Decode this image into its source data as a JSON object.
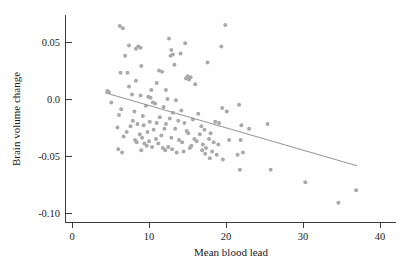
{
  "chart_data": {
    "type": "scatter",
    "title": "",
    "xlabel": "Mean blood lead",
    "ylabel": "Brain volume change",
    "xlim": [
      -1.0,
      42.5
    ],
    "ylim": [
      -0.115,
      0.075
    ],
    "grid": false,
    "legend": null,
    "xticks": [
      0,
      10,
      20,
      30,
      40
    ],
    "xticklabels": [
      "0",
      "10",
      "20",
      "30",
      "40"
    ],
    "yticks": [
      0.05,
      0.0,
      -0.05,
      -0.1
    ],
    "yticklabels": [
      "0.05",
      "0.0",
      "-0.05",
      "-0.10"
    ],
    "marker": {
      "shape": "circle",
      "color": "#a9a9a9",
      "size": 2.0
    },
    "series": [
      {
        "name": "Subjects",
        "points": [
          [
            6.2,
            0.064
          ],
          [
            6.6,
            0.062
          ],
          [
            19.9,
            0.065
          ],
          [
            12.6,
            0.053
          ],
          [
            14.7,
            0.049
          ],
          [
            7.4,
            0.047
          ],
          [
            8.6,
            0.046
          ],
          [
            8.9,
            0.045
          ],
          [
            8.3,
            0.044
          ],
          [
            19.4,
            0.046
          ],
          [
            12.9,
            0.043
          ],
          [
            14.1,
            0.04
          ],
          [
            13.1,
            0.039
          ],
          [
            12.8,
            0.038
          ],
          [
            6.9,
            0.038
          ],
          [
            17.6,
            0.032
          ],
          [
            13.3,
            0.03
          ],
          [
            9.0,
            0.029
          ],
          [
            11.3,
            0.025
          ],
          [
            11.7,
            0.024
          ],
          [
            6.3,
            0.023
          ],
          [
            7.2,
            0.023
          ],
          [
            15.0,
            0.02
          ],
          [
            15.4,
            0.019
          ],
          [
            14.8,
            0.018
          ],
          [
            15.2,
            0.017
          ],
          [
            8.3,
            0.016
          ],
          [
            11.0,
            0.014
          ],
          [
            16.0,
            0.013
          ],
          [
            7.4,
            0.011
          ],
          [
            10.3,
            0.008
          ],
          [
            12.2,
            0.008
          ],
          [
            4.6,
            0.007
          ],
          [
            4.8,
            0.006
          ],
          [
            7.8,
            0.004
          ],
          [
            8.9,
            0.003
          ],
          [
            9.9,
            0.002
          ],
          [
            10.2,
            0.001
          ],
          [
            12.4,
            0.0
          ],
          [
            13.5,
            -0.001
          ],
          [
            5.1,
            -0.003
          ],
          [
            10.5,
            -0.003
          ],
          [
            10.8,
            -0.004
          ],
          [
            9.6,
            -0.006
          ],
          [
            11.9,
            -0.007
          ],
          [
            6.4,
            -0.009
          ],
          [
            14.2,
            -0.01
          ],
          [
            8.1,
            -0.011
          ],
          [
            21.7,
            -0.005
          ],
          [
            19.5,
            -0.008
          ],
          [
            13.1,
            -0.012
          ],
          [
            16.4,
            -0.013
          ],
          [
            20.1,
            -0.011
          ],
          [
            6.1,
            -0.014
          ],
          [
            9.2,
            -0.015
          ],
          [
            11.4,
            -0.016
          ],
          [
            12.7,
            -0.017
          ],
          [
            15.7,
            -0.018
          ],
          [
            7.9,
            -0.019
          ],
          [
            10.1,
            -0.02
          ],
          [
            13.8,
            -0.019
          ],
          [
            11.0,
            -0.021
          ],
          [
            12.2,
            -0.022
          ],
          [
            8.5,
            -0.022
          ],
          [
            9.3,
            -0.023
          ],
          [
            14.6,
            -0.021
          ],
          [
            18.6,
            -0.02
          ],
          [
            19.1,
            -0.021
          ],
          [
            22.0,
            -0.023
          ],
          [
            25.4,
            -0.022
          ],
          [
            16.8,
            -0.024
          ],
          [
            7.6,
            -0.024
          ],
          [
            5.9,
            -0.025
          ],
          [
            12.0,
            -0.026
          ],
          [
            13.4,
            -0.026
          ],
          [
            10.6,
            -0.027
          ],
          [
            14.9,
            -0.028
          ],
          [
            9.8,
            -0.029
          ],
          [
            17.2,
            -0.027
          ],
          [
            15.1,
            -0.03
          ],
          [
            18.0,
            -0.03
          ],
          [
            8.8,
            -0.031
          ],
          [
            11.6,
            -0.032
          ],
          [
            16.6,
            -0.031
          ],
          [
            21.9,
            -0.036
          ],
          [
            6.7,
            -0.033
          ],
          [
            9.1,
            -0.034
          ],
          [
            12.9,
            -0.034
          ],
          [
            15.9,
            -0.035
          ],
          [
            17.8,
            -0.035
          ],
          [
            8.2,
            -0.036
          ],
          [
            10.0,
            -0.037
          ],
          [
            13.9,
            -0.036
          ],
          [
            16.2,
            -0.037
          ],
          [
            18.4,
            -0.038
          ],
          [
            8.4,
            -0.038
          ],
          [
            9.4,
            -0.039
          ],
          [
            11.2,
            -0.039
          ],
          [
            14.3,
            -0.038
          ],
          [
            17.0,
            -0.04
          ],
          [
            19.0,
            -0.04
          ],
          [
            9.7,
            -0.041
          ],
          [
            10.4,
            -0.042
          ],
          [
            12.5,
            -0.042
          ],
          [
            15.5,
            -0.041
          ],
          [
            17.4,
            -0.043
          ],
          [
            6.0,
            -0.044
          ],
          [
            13.0,
            -0.044
          ],
          [
            16.9,
            -0.045
          ],
          [
            18.2,
            -0.046
          ],
          [
            22.2,
            -0.047
          ],
          [
            6.5,
            -0.047
          ],
          [
            9.0,
            -0.045
          ],
          [
            12.1,
            -0.045
          ],
          [
            14.5,
            -0.046
          ],
          [
            17.3,
            -0.048
          ],
          [
            18.8,
            -0.049
          ],
          [
            21.5,
            -0.049
          ],
          [
            19.6,
            -0.053
          ],
          [
            17.9,
            -0.052
          ],
          [
            21.8,
            -0.062
          ],
          [
            25.8,
            -0.062
          ],
          [
            30.3,
            -0.073
          ],
          [
            36.9,
            -0.08
          ],
          [
            34.6,
            -0.091
          ],
          [
            15.3,
            -0.043
          ],
          [
            11.8,
            -0.043
          ],
          [
            13.6,
            -0.047
          ],
          [
            20.4,
            -0.036
          ],
          [
            23.0,
            -0.026
          ],
          [
            10.9,
            -0.035
          ],
          [
            7.1,
            -0.029
          ]
        ]
      }
    ],
    "fit_line": {
      "name": "linear-fit",
      "color": "#9a9a9a",
      "x0": 4.3,
      "y0": 0.0055,
      "x1": 37.0,
      "y1": -0.0585
    }
  }
}
